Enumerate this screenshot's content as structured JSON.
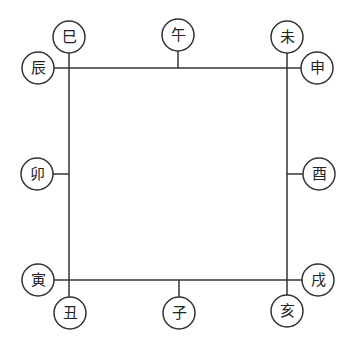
{
  "diagram": {
    "type": "twelve-earthly-branches-square",
    "colors": {
      "stroke": "#333333",
      "text": "#222222",
      "background": "#ffffff"
    },
    "square": {
      "left": 69,
      "top": 68,
      "right": 287,
      "bottom": 280
    },
    "nodes": [
      {
        "id": "si",
        "label": "巳",
        "cx": 69,
        "cy": 37,
        "anchor": [
          69,
          53
        ]
      },
      {
        "id": "wu",
        "label": "午",
        "cx": 178,
        "cy": 35,
        "anchor": [
          178,
          51
        ]
      },
      {
        "id": "wei",
        "label": "未",
        "cx": 287,
        "cy": 37,
        "anchor": [
          287,
          53
        ]
      },
      {
        "id": "chen",
        "label": "辰",
        "cx": 38,
        "cy": 68,
        "anchor": [
          54,
          68
        ]
      },
      {
        "id": "shen",
        "label": "申",
        "cx": 317,
        "cy": 68,
        "anchor": [
          301,
          68
        ]
      },
      {
        "id": "mao",
        "label": "卯",
        "cx": 37,
        "cy": 174,
        "anchor": [
          53,
          174
        ]
      },
      {
        "id": "you",
        "label": "酉",
        "cx": 319,
        "cy": 174,
        "anchor": [
          303,
          174
        ]
      },
      {
        "id": "yin",
        "label": "寅",
        "cx": 38,
        "cy": 280,
        "anchor": [
          54,
          280
        ]
      },
      {
        "id": "xu",
        "label": "戌",
        "cx": 318,
        "cy": 280,
        "anchor": [
          302,
          280
        ]
      },
      {
        "id": "chou",
        "label": "丑",
        "cx": 70,
        "cy": 313,
        "anchor": [
          70,
          297
        ]
      },
      {
        "id": "zi",
        "label": "子",
        "cx": 179,
        "cy": 313,
        "anchor": [
          179,
          297
        ]
      },
      {
        "id": "hai",
        "label": "亥",
        "cx": 287,
        "cy": 311,
        "anchor": [
          287,
          295
        ]
      }
    ],
    "node_radius": 16
  }
}
